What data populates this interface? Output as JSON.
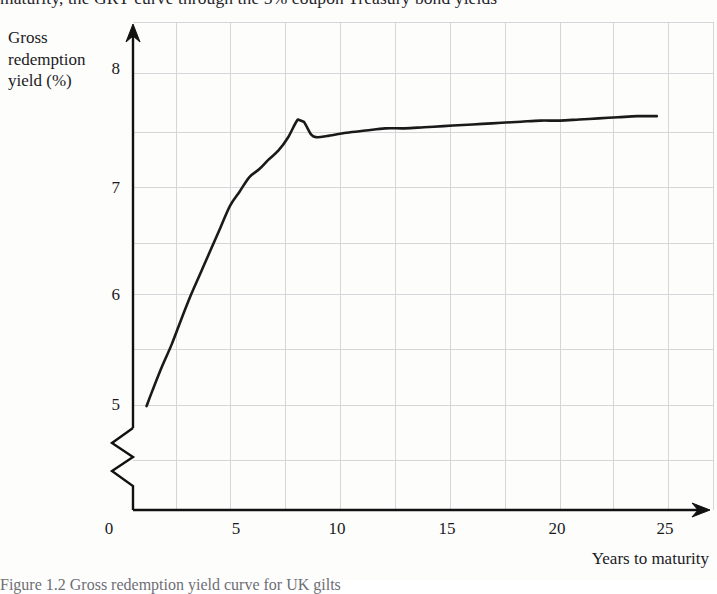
{
  "page": {
    "top_clipped_text": "maturity, the GRY curve through the 5% coupon Treasury bond yields",
    "bottom_clipped_text": "Figure 1.2 Gross redemption yield curve for UK gilts"
  },
  "chart_data": {
    "type": "line",
    "title": "",
    "xlabel": "Years to maturity",
    "ylabel": "Gross redemption yield (%)",
    "xlim": [
      0,
      27.5
    ],
    "ylim": [
      4.75,
      8.25
    ],
    "yaxis_break": true,
    "yaxis_break_note": "zigzag break between 0 and 5",
    "grid": true,
    "grid_x_step": 2.5,
    "grid_y_step": 0.5,
    "legend": "none",
    "xticks": [
      "0",
      "5",
      "10",
      "15",
      "20",
      "25"
    ],
    "xtick_values": [
      0,
      5,
      10,
      15,
      20,
      25
    ],
    "yticks": [
      "5",
      "6",
      "7",
      "8"
    ],
    "ytick_values": [
      5,
      6,
      7,
      8
    ],
    "series": [
      {
        "name": "Gross redemption yield",
        "color": "#1a1a1a",
        "x": [
          0.7,
          1.0,
          1.5,
          2.0,
          2.5,
          3.0,
          3.5,
          4.0,
          4.5,
          5.0,
          5.5,
          6.0,
          6.5,
          7.0,
          7.5,
          8.0,
          8.5,
          8.8,
          9.2,
          9.5,
          10.0,
          11.0,
          12.0,
          13.0,
          14.0,
          15.0,
          16.0,
          17.0,
          18.0,
          19.0,
          20.0,
          21.0,
          22.0,
          23.0,
          24.0,
          25.0,
          26.0,
          27.0
        ],
        "y": [
          4.99,
          5.13,
          5.35,
          5.55,
          5.78,
          6.0,
          6.2,
          6.4,
          6.6,
          6.8,
          6.93,
          7.06,
          7.13,
          7.22,
          7.3,
          7.42,
          7.58,
          7.56,
          7.44,
          7.42,
          7.43,
          7.46,
          7.48,
          7.5,
          7.5,
          7.51,
          7.52,
          7.53,
          7.54,
          7.55,
          7.56,
          7.57,
          7.57,
          7.58,
          7.59,
          7.6,
          7.61,
          7.61
        ]
      }
    ]
  },
  "axes": {
    "y_title_line1": "Gross",
    "y_title_line2": "redemption",
    "y_title_line3": "yield (%)",
    "x_title": "Years to maturity"
  },
  "colors": {
    "curve": "#1a1a1a",
    "axis": "#111111",
    "grid": "#d4d4d8",
    "background": "#fdfdfc"
  }
}
